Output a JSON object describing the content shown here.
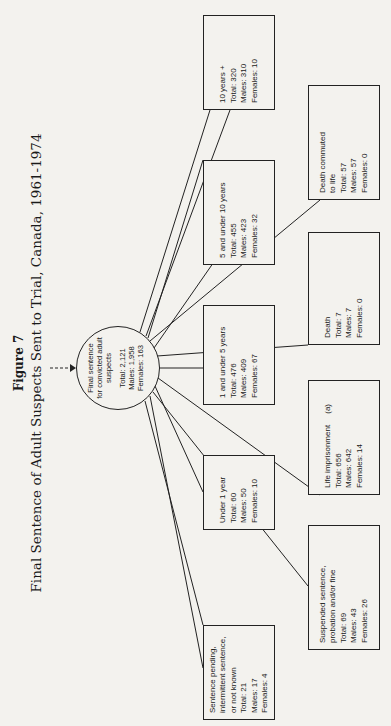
{
  "figure": {
    "label": "Figure 7",
    "title": "Final Sentence of Adult Suspects Sent to Trial, Canada, 1961-1974"
  },
  "root": {
    "label_lines": [
      "Final sentence",
      "for convicted adult",
      "suspects"
    ],
    "total": "Total: 2,121",
    "males": "Males: 1,958",
    "females": "Females: 163"
  },
  "nodes": [
    {
      "id": "pending",
      "label_lines": [
        "Sentence pending,",
        "intermittent sentence,",
        "or not known"
      ],
      "total": "Total: 21",
      "males": "Males: 17",
      "females": "Females: 4"
    },
    {
      "id": "suspended",
      "label_lines": [
        "Suspended sentence,",
        "probation and/or fine"
      ],
      "total": "Total: 69",
      "males": "Males: 43",
      "females": "Females: 26"
    },
    {
      "id": "under1",
      "label_lines": [
        "Under 1 year"
      ],
      "total": "Total: 60",
      "males": "Males: 50",
      "females": "Females: 10"
    },
    {
      "id": "life",
      "label_lines": [
        "Life imprisonment     (a)"
      ],
      "total": "Total: 656",
      "males": "Males: 642",
      "females": "Females: 14"
    },
    {
      "id": "1to5",
      "label_lines": [
        "1 and under 5 years"
      ],
      "total": "Total: 476",
      "males": "Males: 409",
      "females": "Females: 67"
    },
    {
      "id": "death",
      "label_lines": [
        "Death"
      ],
      "total": "Total: 7",
      "males": "Males: 7",
      "females": "Females: 0"
    },
    {
      "id": "5to10",
      "label_lines": [
        "5 and under 10 years"
      ],
      "total": "Total: 455",
      "males": "Males: 423",
      "females": "Females: 32"
    },
    {
      "id": "commuted",
      "label_lines": [
        "Death commuted",
        "to life"
      ],
      "total": "Total: 57",
      "males": "Males: 57",
      "females": "Females: 0"
    },
    {
      "id": "10plus",
      "label_lines": [
        "10 years +"
      ],
      "total": "Total: 320",
      "males": "Males: 310",
      "females": "Females: 10"
    }
  ],
  "colors": {
    "paper": "#f3f2ee",
    "ink": "#1a1a1a"
  }
}
